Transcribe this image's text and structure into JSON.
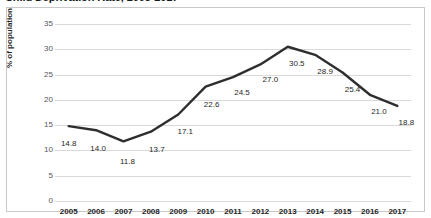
{
  "chart_data": {
    "type": "line",
    "title": "Child Deprivation Rate, 2005-2017",
    "xlabel": "",
    "ylabel": "% of population",
    "categories": [
      "2005",
      "2006",
      "2007",
      "2008",
      "2009",
      "2010",
      "2011",
      "2012",
      "2013",
      "2014",
      "2015",
      "2016",
      "2017"
    ],
    "values": [
      14.8,
      14.0,
      11.8,
      13.7,
      17.1,
      22.6,
      24.5,
      27.0,
      30.5,
      28.9,
      25.4,
      21.0,
      18.8
    ],
    "point_labels": [
      "14.8",
      "14.0",
      "11.8",
      "13.7",
      "17.1",
      "22.6",
      "24.5",
      "27.0",
      "30.5",
      "28.9",
      "25.4",
      "21.0",
      "18.8"
    ],
    "ylim": [
      0,
      35
    ],
    "y_ticks": [
      0,
      5,
      10,
      15,
      20,
      25,
      30,
      35
    ],
    "y_tick_labels": [
      "0",
      "5",
      "10",
      "15",
      "20",
      "25",
      "30",
      "35"
    ],
    "grid": "horizontal",
    "legend": "none",
    "series_color": "#2e2e2e",
    "gridline_color": "#d9d9d9",
    "border_color": "#c8c8c8",
    "background_color": "#ffffff"
  }
}
